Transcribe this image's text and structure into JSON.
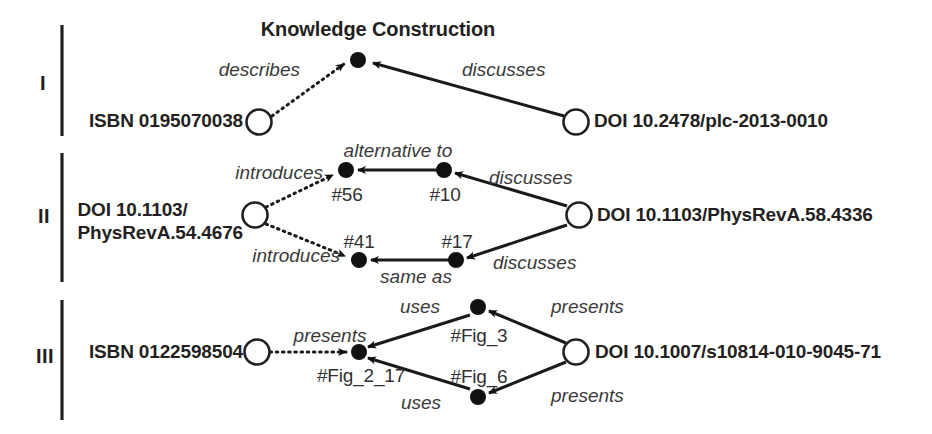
{
  "figure": {
    "title": "Knowledge Construction",
    "colors": {
      "ink": "#231f20",
      "edge": "#1a1a1a",
      "label": "#3a3a3a",
      "background": "#ffffff"
    }
  },
  "rows": [
    {
      "numeral": "I",
      "title": "Knowledge Construction",
      "nodes": {
        "left_resource": "ISBN 0195070038",
        "right_resource": "DOI 10.2478/plc-2013-0010"
      },
      "edges": [
        {
          "label": "describes",
          "style": "dotted"
        },
        {
          "label": "discusses",
          "style": "solid"
        }
      ],
      "statements": []
    },
    {
      "numeral": "II",
      "nodes": {
        "left_resource_line1": "DOI 10.1103/",
        "left_resource_line2": "PhysRevA.54.4676",
        "right_resource": "DOI 10.1103/PhysRevA.58.4336"
      },
      "edges": [
        {
          "label": "introduces",
          "style": "dotted"
        },
        {
          "label": "introduces",
          "style": "dotted"
        },
        {
          "label": "alternative to",
          "style": "solid"
        },
        {
          "label": "same as",
          "style": "solid"
        },
        {
          "label": "discusses",
          "style": "solid"
        },
        {
          "label": "discusses",
          "style": "solid"
        }
      ],
      "statements": [
        {
          "id": "#56"
        },
        {
          "id": "#10"
        },
        {
          "id": "#41"
        },
        {
          "id": "#17"
        }
      ]
    },
    {
      "numeral": "III",
      "nodes": {
        "left_resource": "ISBN 0122598504",
        "right_resource": "DOI 10.1007/s10814-010-9045-71"
      },
      "edges": [
        {
          "label": "presents",
          "style": "dotted"
        },
        {
          "label": "uses",
          "style": "solid"
        },
        {
          "label": "uses",
          "style": "solid"
        },
        {
          "label": "presents",
          "style": "solid"
        },
        {
          "label": "presents",
          "style": "solid"
        }
      ],
      "statements": [
        {
          "id": "#Fig_2_17"
        },
        {
          "id": "#Fig_3"
        },
        {
          "id": "#Fig_6"
        }
      ]
    }
  ]
}
